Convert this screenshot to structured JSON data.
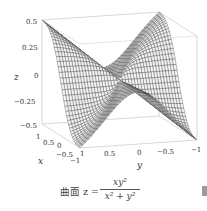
{
  "chart_data": {
    "type": "surface3d",
    "title": "",
    "function": "z = x*y^2/(x^2+y^2)",
    "x_range": [
      -1,
      1
    ],
    "y_range": [
      -1,
      1
    ],
    "z_range": [
      -0.5,
      0.5
    ],
    "grid": {
      "radial_style_mesh": true,
      "n": 40
    },
    "xlabel": "x",
    "ylabel": "y",
    "zlabel": "z",
    "x_ticks": [
      "1",
      "0.5",
      "0",
      "−0.5",
      "−1"
    ],
    "y_ticks": [
      "1",
      "0.5",
      "0",
      "−0.5",
      "−1"
    ],
    "z_ticks": [
      "0.5",
      "0.25",
      "0",
      "−0.25",
      "−0.5"
    ],
    "colors": {
      "mesh": "#3a3a3a",
      "surface": "#f4f4f4",
      "box": "#bdbdbd"
    }
  },
  "caption": {
    "prefix": "曲面 z =",
    "numerator": "xy²",
    "denominator": "x² + y²"
  }
}
